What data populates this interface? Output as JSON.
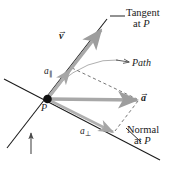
{
  "figure": {
    "labels": {
      "tangent_line1": "Tangent",
      "tangent_line2": "at P",
      "normal_line1": "Normal",
      "normal_line2": "at P",
      "path": "Path",
      "point_p": "P",
      "velocity_vector": "v",
      "velocity_arrow_glyph": "→",
      "acceleration_vector": "a",
      "acceleration_arrow_glyph": "→",
      "a_parallel_base": "a",
      "a_parallel_subscript": "∥",
      "a_perpendicular_base": "a",
      "a_perpendicular_subscript": "⊥"
    },
    "colors": {
      "background": "#ffffff",
      "line_black": "#1a1a1a",
      "vector_gray": "#a8a8a8",
      "vector_gray_dark": "#8f8f8f",
      "arc_gray": "#b5b5b5",
      "dashed_gray": "#6d6d6d",
      "point_fill": "#111111",
      "text": "#1a1a1a"
    },
    "geometry": {
      "point_p": [
        47,
        99
      ],
      "tangent_line_start": [
        7,
        148
      ],
      "tangent_line_end": [
        107,
        19
      ],
      "normal_line_start": [
        4,
        79
      ],
      "normal_line_end": [
        160,
        160
      ],
      "velocity_tip": [
        100,
        29
      ],
      "acceleration_tip": [
        139,
        100
      ],
      "a_parallel_tip": [
        70,
        70
      ],
      "a_perpendicular_tip": [
        113,
        130
      ],
      "path_arc_start": [
        58,
        82
      ],
      "path_arc_end": [
        130,
        62
      ],
      "tangent_leader_start": [
        111,
        23
      ],
      "tangent_leader_end": [
        123,
        13
      ],
      "normal_leader_start": [
        140,
        141
      ],
      "normal_leader_end": [
        126,
        129
      ],
      "indicator_arrow_start": [
        31,
        153
      ],
      "indicator_arrow_end": [
        31,
        131
      ]
    }
  }
}
